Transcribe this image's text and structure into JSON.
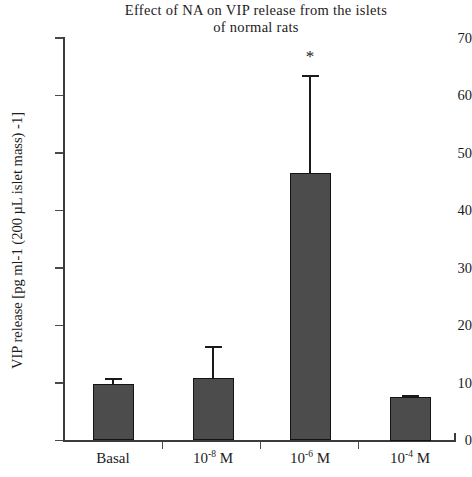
{
  "chart_data": {
    "type": "bar",
    "title": "Effect of NA on VIP release from  the islets of normal rats",
    "title_lines": [
      "Effect of NA on VIP release from  the islets",
      "of normal rats"
    ],
    "xlabel": "",
    "ylabel": "VIP release [pg ml-1 (200 µL islet mass) -1]",
    "categories": [
      "Basal",
      "10-8 M",
      "10-6 M",
      "10-4 M"
    ],
    "category_labels": [
      {
        "base": "Basal",
        "exponent": "",
        "suffix": ""
      },
      {
        "base": "10",
        "exponent": "-8",
        "suffix": " M"
      },
      {
        "base": "10",
        "exponent": "-6",
        "suffix": " M"
      },
      {
        "base": "10",
        "exponent": "-4",
        "suffix": " M"
      }
    ],
    "values": [
      9.8,
      10.8,
      46.6,
      7.5
    ],
    "errors": [
      1.1,
      5.6,
      17.0,
      0.4
    ],
    "error_tops": [
      10.9,
      16.4,
      63.6,
      7.9
    ],
    "annotations": [
      {
        "category": "10-6 M",
        "text": "*",
        "y": 66.5
      }
    ],
    "ylim": [
      0,
      70
    ],
    "yticks": [
      0,
      10,
      20,
      30,
      40,
      50,
      60,
      70
    ],
    "ytick_labels": [
      "0",
      "10",
      "20",
      "30",
      "40",
      "50",
      "60",
      "70"
    ],
    "grid": false,
    "legend": null,
    "bar_color": "#4c4c4c",
    "bar_edge_color": "#141414",
    "axis_color": "#3b3b3b"
  }
}
